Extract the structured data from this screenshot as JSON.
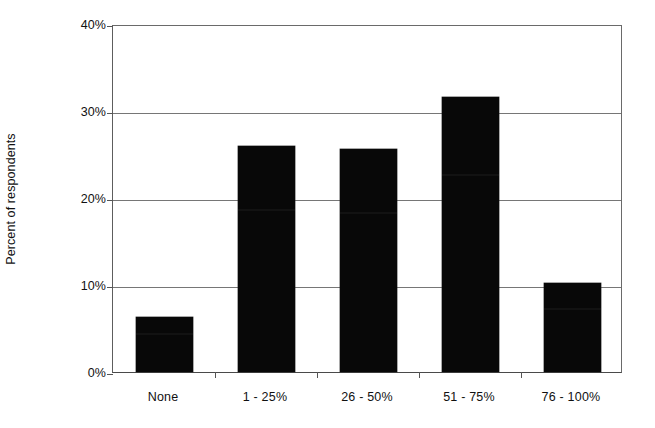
{
  "chart_data": {
    "type": "bar",
    "title": "",
    "subtitle": "",
    "xlabel": "",
    "ylabel": "Percent of respondents",
    "categories": [
      "None",
      "1 - 25%",
      "26 - 50%",
      "51 - 75%",
      "76 - 100%"
    ],
    "values": [
      6.3,
      26.0,
      25.6,
      31.6,
      10.2
    ],
    "ylim": [
      0,
      40
    ],
    "ytick_labels": [
      "0%",
      "10%",
      "20%",
      "30%",
      "40%"
    ],
    "ytick_values": [
      0,
      10,
      20,
      30,
      40
    ],
    "grid": true,
    "legend": false,
    "legend_position": "none",
    "bar_color": "#080808",
    "axis_color": "#555555",
    "gridline_color": "#767676",
    "background_color": "#ffffff",
    "text_color": "#111111"
  }
}
